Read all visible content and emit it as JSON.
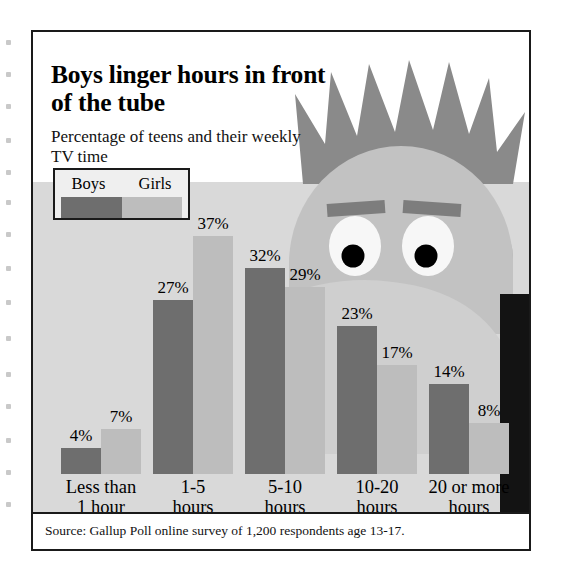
{
  "headline": "Boys linger hours in front of the tube",
  "subhead": "Percentage of teens and their weekly TV time",
  "legend": {
    "boys_label": "Boys",
    "girls_label": "Girls",
    "boys_color": "#6e6e6e",
    "girls_color": "#bdbdbd"
  },
  "source": "Source: Gallup Poll online survey of 1,200 respondents age 13-17.",
  "colors": {
    "panel": "#d9d9d9",
    "frame": "#1a1a1a",
    "hair": "#8a8a8a",
    "skin": "#bcbcbc",
    "body_band": "#131313"
  },
  "chart_data": {
    "type": "bar",
    "title": "Boys linger hours in front of the tube",
    "subtitle": "Percentage of teens and their weekly TV time",
    "xlabel": "",
    "ylabel": "Percentage of teens",
    "ylim": [
      0,
      37
    ],
    "grid": false,
    "legend_position": "top-left",
    "value_suffix": "%",
    "categories": [
      "Less than\n1 hour",
      "1-5\nhours",
      "5-10\nhours",
      "10-20\nhours",
      "20 or more\nhours"
    ],
    "category_lines": [
      [
        "Less than",
        "1 hour"
      ],
      [
        "1-5",
        "hours"
      ],
      [
        "5-10",
        "hours"
      ],
      [
        "10-20",
        "hours"
      ],
      [
        "20 or more",
        "hours"
      ]
    ],
    "series": [
      {
        "name": "Boys",
        "color": "#6e6e6e",
        "values": [
          4,
          27,
          32,
          23,
          14
        ],
        "labels": [
          "4%",
          "27%",
          "32%",
          "23%",
          "14%"
        ]
      },
      {
        "name": "Girls",
        "color": "#bdbdbd",
        "values": [
          7,
          37,
          29,
          17,
          8
        ],
        "labels": [
          "7%",
          "37%",
          "29%",
          "17%",
          "8%"
        ]
      }
    ],
    "source": "Source: Gallup Poll online survey of 1,200 respondents age 13-17."
  }
}
